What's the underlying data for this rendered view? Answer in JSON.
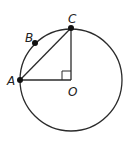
{
  "diagram": {
    "colors": {
      "stroke": "#2b2b2b",
      "point": "#111111",
      "label": "#222222"
    },
    "circle": {
      "center": "O",
      "cx": 71,
      "cy": 80,
      "r": 51
    },
    "points": [
      {
        "id": "A",
        "label": "A",
        "x": 20,
        "y": 80,
        "dot": true
      },
      {
        "id": "B",
        "label": "B",
        "x": 35,
        "y": 43,
        "dot": true
      },
      {
        "id": "C",
        "label": "C",
        "x": 71,
        "y": 28,
        "dot": true
      },
      {
        "id": "O",
        "label": "O",
        "x": 71,
        "y": 80,
        "dot": false
      }
    ],
    "segments": [
      {
        "from": "A",
        "to": "C"
      },
      {
        "from": "A",
        "to": "O"
      },
      {
        "from": "C",
        "to": "O"
      }
    ],
    "right_angle_marker": {
      "at": "O",
      "size": 9
    }
  }
}
